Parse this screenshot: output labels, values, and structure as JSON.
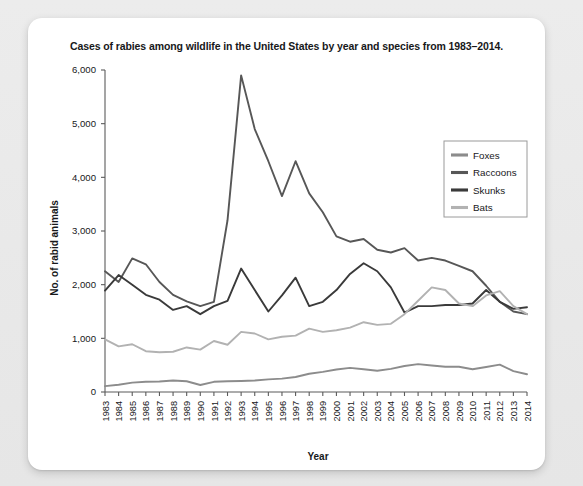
{
  "card": {
    "background_color": "#ffffff",
    "page_background_color": "#e9e9e9"
  },
  "chart_data": {
    "type": "line",
    "title": "Cases of rabies among wildlife in the United States by year and species from 1983–2014.",
    "xlabel": "Year",
    "ylabel": "No. of rabid animals",
    "ylim": [
      0,
      6000
    ],
    "ytick_labels": [
      "0",
      "1,000",
      "2,000",
      "3,000",
      "4,000",
      "5,000",
      "6,000"
    ],
    "ytick_values": [
      0,
      1000,
      2000,
      3000,
      4000,
      5000,
      6000
    ],
    "grid": false,
    "legend_position": "upper-right-inside",
    "categories": [
      "1983",
      "1984",
      "1985",
      "1986",
      "1987",
      "1988",
      "1989",
      "1990",
      "1991",
      "1992",
      "1993",
      "1994",
      "1995",
      "1996",
      "1997",
      "1998",
      "1999",
      "2000",
      "2001",
      "2002",
      "2003",
      "2004",
      "2005",
      "2006",
      "2007",
      "2008",
      "2009",
      "2010",
      "2011",
      "2012",
      "2013",
      "2014"
    ],
    "series": [
      {
        "name": "Foxes",
        "color": "#8c8c8c",
        "values": [
          110,
          135,
          175,
          190,
          195,
          215,
          200,
          130,
          190,
          200,
          205,
          215,
          235,
          250,
          280,
          340,
          375,
          420,
          450,
          425,
          395,
          430,
          485,
          520,
          495,
          470,
          470,
          425,
          465,
          510,
          390,
          330
        ]
      },
      {
        "name": "Raccoons",
        "color": "#575757",
        "values": [
          2250,
          2050,
          2490,
          2380,
          2050,
          1810,
          1690,
          1600,
          1680,
          3200,
          5900,
          4900,
          4300,
          3650,
          4300,
          3700,
          3350,
          2900,
          2800,
          2850,
          2650,
          2600,
          2680,
          2450,
          2500,
          2450,
          2350,
          2250,
          1980,
          1680,
          1500,
          1450
        ]
      },
      {
        "name": "Skunks",
        "color": "#3a3a3a",
        "values": [
          1890,
          2180,
          2000,
          1810,
          1720,
          1530,
          1600,
          1450,
          1600,
          1700,
          2300,
          1900,
          1500,
          1800,
          2130,
          1600,
          1680,
          1900,
          2200,
          2400,
          2250,
          1950,
          1480,
          1600,
          1600,
          1620,
          1620,
          1650,
          1900,
          1680,
          1550,
          1580
        ]
      },
      {
        "name": "Bats",
        "color": "#b2b2b2",
        "values": [
          980,
          850,
          890,
          760,
          740,
          750,
          830,
          790,
          950,
          880,
          1120,
          1090,
          980,
          1030,
          1050,
          1180,
          1120,
          1150,
          1200,
          1300,
          1250,
          1270,
          1450,
          1700,
          1950,
          1900,
          1650,
          1600,
          1800,
          1880,
          1600,
          1450
        ]
      }
    ]
  }
}
